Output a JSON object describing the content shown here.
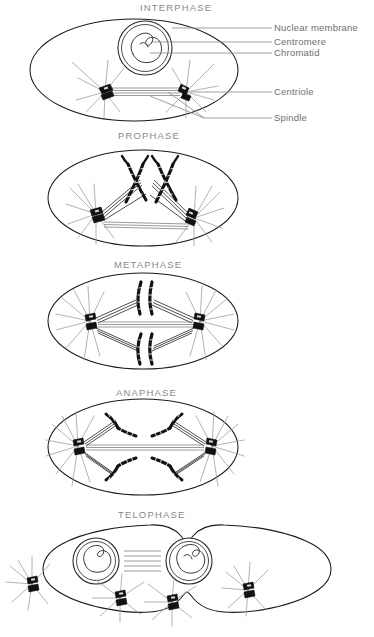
{
  "diagram": {
    "title_hidden": "",
    "background_color": "#ffffff",
    "ink_color": "#111111",
    "title_color": "#8a8a8a",
    "label_color": "#6f6f6f"
  },
  "panels": [
    {
      "id": "interphase",
      "title": "INTERPHASE"
    },
    {
      "id": "prophase",
      "title": "PROPHASE"
    },
    {
      "id": "metaphase",
      "title": "METAPHASE"
    },
    {
      "id": "anaphase",
      "title": "ANAPHASE"
    },
    {
      "id": "telophase",
      "title": "TELOPHASE"
    }
  ],
  "labels": [
    {
      "id": "nuclear-membrane",
      "text": "Nuclear membrane"
    },
    {
      "id": "centromere",
      "text": "Centromere"
    },
    {
      "id": "chromatid",
      "text": "Chromatid"
    },
    {
      "id": "centriole",
      "text": "Centriole"
    },
    {
      "id": "spindle",
      "text": "Spindle"
    }
  ]
}
